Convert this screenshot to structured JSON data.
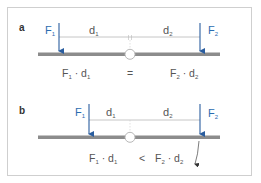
{
  "colors": {
    "force_arrow": "#2a5d9f",
    "force_label": "#3a7bc8",
    "beam": "#8c8c8c",
    "dimension_line": "#b5b5b5",
    "frame": "#cfcfcf",
    "text": "#555555"
  },
  "panel_a": {
    "label": "a",
    "force_left": {
      "symbol": "F",
      "sub": "1"
    },
    "force_right": {
      "symbol": "F",
      "sub": "2"
    },
    "distance_left": {
      "symbol": "d",
      "sub": "1"
    },
    "distance_right": {
      "symbol": "d",
      "sub": "2"
    },
    "equation": {
      "left": {
        "f": "F",
        "f_sub": "1",
        "dot": "·",
        "d": "d",
        "d_sub": "1"
      },
      "operator": "=",
      "right": {
        "f": "F",
        "f_sub": "2",
        "dot": "·",
        "d": "d",
        "d_sub": "2"
      }
    }
  },
  "panel_b": {
    "label": "b",
    "force_left": {
      "symbol": "F",
      "sub": "1"
    },
    "force_right": {
      "symbol": "F",
      "sub": "2"
    },
    "distance_left": {
      "symbol": "d",
      "sub": "1"
    },
    "distance_right": {
      "symbol": "d",
      "sub": "2"
    },
    "equation": {
      "left": {
        "f": "F",
        "f_sub": "1",
        "dot": "·",
        "d": "d",
        "d_sub": "1"
      },
      "operator": "<",
      "right": {
        "f": "F",
        "f_sub": "2",
        "dot": "·",
        "d": "d",
        "d_sub": "2"
      }
    }
  }
}
